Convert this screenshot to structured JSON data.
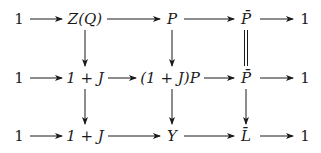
{
  "diagram": {
    "type": "commutative-diagram",
    "rows": [
      {
        "nodes": [
          "1",
          "Z(Q)",
          "P",
          "P̄",
          "1"
        ]
      },
      {
        "nodes": [
          "1",
          "1+J",
          "(1+J)P",
          "P̄",
          "1"
        ]
      },
      {
        "nodes": [
          "1",
          "1+J",
          "Y",
          "L̄",
          "1"
        ]
      }
    ],
    "vertical_arrows": [
      {
        "from": "Z(Q)",
        "to": "1+J",
        "style": "arrow"
      },
      {
        "from": "P",
        "to": "(1+J)P",
        "style": "arrow"
      },
      {
        "from": "P̄",
        "to": "P̄",
        "style": "double-line-equality"
      },
      {
        "from": "1+J",
        "to": "1+J",
        "style": "arrow"
      },
      {
        "from": "(1+J)P",
        "to": "Y",
        "style": "arrow"
      },
      {
        "from": "P̄",
        "to": "L̄",
        "style": "arrow"
      }
    ]
  },
  "labels": {
    "r0c0": "1",
    "r0c1": "Z(Q)",
    "r0c2": "P",
    "r0c3": "P̄",
    "r0c4": "1",
    "r1c0": "1",
    "r1c1": "1 + J",
    "r1c2": "(1 + J)P",
    "r1c3": "P̄",
    "r1c4": "1",
    "r2c0": "1",
    "r2c1": "1 + J",
    "r2c2": "Y",
    "r2c3": "L̄",
    "r2c4": "1"
  }
}
